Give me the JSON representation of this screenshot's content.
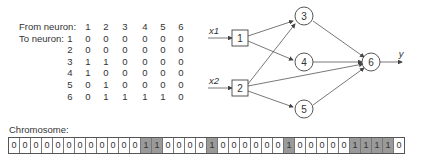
{
  "matrix": {
    "from_label": "From neuron:",
    "to_label": "To neuron:",
    "col_headers": [
      "1",
      "2",
      "3",
      "4",
      "5",
      "6"
    ],
    "rows": [
      {
        "label": "1",
        "values": [
          "0",
          "0",
          "0",
          "0",
          "0",
          "0"
        ]
      },
      {
        "label": "2",
        "values": [
          "0",
          "0",
          "0",
          "0",
          "0",
          "0"
        ]
      },
      {
        "label": "3",
        "values": [
          "1",
          "1",
          "0",
          "0",
          "0",
          "0"
        ]
      },
      {
        "label": "4",
        "values": [
          "1",
          "0",
          "0",
          "0",
          "0",
          "0"
        ]
      },
      {
        "label": "5",
        "values": [
          "0",
          "1",
          "0",
          "0",
          "0",
          "0"
        ]
      },
      {
        "label": "6",
        "values": [
          "0",
          "1",
          "1",
          "1",
          "1",
          "0"
        ]
      }
    ]
  },
  "network": {
    "inputs": [
      "x1",
      "x2"
    ],
    "output": "y",
    "nodes": [
      "1",
      "2",
      "3",
      "4",
      "5",
      "6"
    ]
  },
  "chromosome": {
    "label": "Chromosome:",
    "bits": [
      "0",
      "0",
      "0",
      "0",
      "0",
      "0",
      "0",
      "0",
      "0",
      "0",
      "0",
      "0",
      "1",
      "1",
      "0",
      "0",
      "0",
      "0",
      "1",
      "0",
      "0",
      "0",
      "0",
      "0",
      "0",
      "1",
      "0",
      "0",
      "0",
      "0",
      "0",
      "1",
      "1",
      "1",
      "1",
      "0"
    ]
  }
}
